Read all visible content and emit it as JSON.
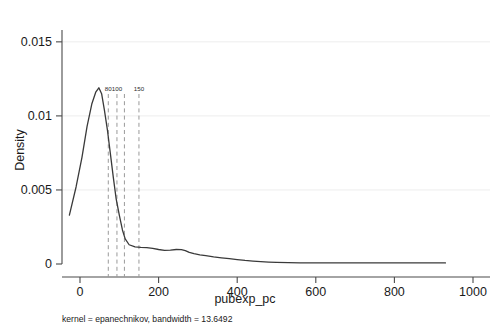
{
  "chart_data": {
    "type": "line",
    "title": "",
    "subtitle": "",
    "xlabel": "pubexp_pc",
    "ylabel": "Density",
    "caption": "kernel = epanechnikov, bandwidth = 13.6492",
    "xlim": [
      -30,
      1010
    ],
    "ylim": [
      0,
      0.0158
    ],
    "grid": true,
    "legend": "none",
    "xticks": [
      0,
      200,
      400,
      600,
      800,
      1000
    ],
    "xtick_labels": [
      "0",
      "200",
      "400",
      "600",
      "800",
      "1000"
    ],
    "yticks": [
      0,
      0.005,
      0.01,
      0.015
    ],
    "ytick_labels": [
      "0",
      "0.005",
      "0.01",
      "0.015"
    ],
    "series": [
      {
        "name": "Density",
        "x": [
          -27,
          -10,
          5,
          18,
          30,
          40,
          48,
          55,
          62,
          70,
          78,
          85,
          92,
          100,
          108,
          115,
          125,
          140,
          155,
          170,
          185,
          200,
          215,
          230,
          245,
          258,
          268,
          278,
          290,
          305,
          320,
          340,
          360,
          380,
          400,
          420,
          440,
          460,
          480,
          500,
          530,
          560,
          600,
          650,
          700,
          750,
          800,
          850,
          900,
          930
        ],
        "y": [
          0.0033,
          0.0052,
          0.0072,
          0.0093,
          0.0108,
          0.0116,
          0.0119,
          0.0115,
          0.0104,
          0.009,
          0.0073,
          0.0058,
          0.0044,
          0.0033,
          0.0023,
          0.0017,
          0.0013,
          0.00115,
          0.00112,
          0.0011,
          0.00105,
          0.00098,
          0.00092,
          0.00094,
          0.00098,
          0.00097,
          0.0009,
          0.00078,
          0.0007,
          0.00062,
          0.00056,
          0.00048,
          0.00042,
          0.00036,
          0.0003,
          0.00024,
          0.0002,
          0.00016,
          0.00013,
          0.00011,
          9e-05,
          8e-05,
          8e-05,
          8e-05,
          8e-05,
          7e-05,
          7e-05,
          7e-05,
          7e-05,
          7e-05
        ]
      }
    ],
    "vlines": [
      {
        "label": "80",
        "x": 72
      },
      {
        "label": "100",
        "x": 94
      },
      {
        "label": "",
        "x": 113
      },
      {
        "label": "150",
        "x": 150
      }
    ]
  }
}
